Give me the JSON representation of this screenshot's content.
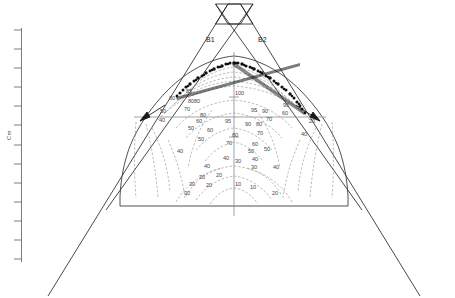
{
  "figure": {
    "kind": "radiotherapy-isodose-distribution",
    "axis": {
      "caption": "Cm",
      "orientation": "vertical",
      "tick_count": 13,
      "line_color": "#6e6f73"
    },
    "beams": [
      {
        "id": "B1",
        "label": "B1",
        "side": "left"
      },
      {
        "id": "B2",
        "label": "B2",
        "side": "right"
      }
    ],
    "colors": {
      "outline": "#1a1a1a",
      "isodose": "#8e8e92",
      "reference": "#8c8c90",
      "scatter": "#111111",
      "body": "#3c3c3e"
    },
    "isodose_levels": [
      100,
      95,
      90,
      85,
      80,
      70,
      60,
      50,
      40,
      30,
      20,
      10
    ],
    "isodose_labels": [
      {
        "text": "85",
        "x": 186,
        "y": 88
      },
      {
        "text": "80",
        "x": 169,
        "y": 95
      },
      {
        "text": "8080",
        "x": 188,
        "y": 98
      },
      {
        "text": "50",
        "x": 160,
        "y": 108
      },
      {
        "text": "70",
        "x": 184,
        "y": 106
      },
      {
        "text": "100",
        "x": 235,
        "y": 90
      },
      {
        "text": "95",
        "x": 283,
        "y": 102
      },
      {
        "text": "60",
        "x": 282,
        "y": 110
      },
      {
        "text": "80",
        "x": 200,
        "y": 112
      },
      {
        "text": "95",
        "x": 251,
        "y": 107
      },
      {
        "text": "90",
        "x": 262,
        "y": 108
      },
      {
        "text": "70",
        "x": 266,
        "y": 116
      },
      {
        "text": "40",
        "x": 159,
        "y": 117
      },
      {
        "text": "60",
        "x": 196,
        "y": 118
      },
      {
        "text": "95",
        "x": 225,
        "y": 118
      },
      {
        "text": "90",
        "x": 245,
        "y": 121
      },
      {
        "text": "80",
        "x": 256,
        "y": 121
      },
      {
        "text": "20",
        "x": 309,
        "y": 118
      },
      {
        "text": "50",
        "x": 188,
        "y": 125
      },
      {
        "text": "60",
        "x": 207,
        "y": 127
      },
      {
        "text": "80",
        "x": 232,
        "y": 132
      },
      {
        "text": "70",
        "x": 257,
        "y": 130
      },
      {
        "text": "40",
        "x": 301,
        "y": 131
      },
      {
        "text": "50",
        "x": 198,
        "y": 136
      },
      {
        "text": "70",
        "x": 226,
        "y": 140
      },
      {
        "text": "60",
        "x": 252,
        "y": 141
      },
      {
        "text": "40",
        "x": 177,
        "y": 148
      },
      {
        "text": "50",
        "x": 248,
        "y": 148
      },
      {
        "text": "50",
        "x": 264,
        "y": 146
      },
      {
        "text": "40",
        "x": 223,
        "y": 155
      },
      {
        "text": "30",
        "x": 235,
        "y": 158
      },
      {
        "text": "40",
        "x": 252,
        "y": 156
      },
      {
        "text": "40",
        "x": 204,
        "y": 163
      },
      {
        "text": "30",
        "x": 251,
        "y": 164
      },
      {
        "text": "40",
        "x": 273,
        "y": 164
      },
      {
        "text": "30",
        "x": 199,
        "y": 174
      },
      {
        "text": "20",
        "x": 216,
        "y": 172
      },
      {
        "text": "30",
        "x": 189,
        "y": 181
      },
      {
        "text": "20",
        "x": 206,
        "y": 182
      },
      {
        "text": "10",
        "x": 235,
        "y": 181
      },
      {
        "text": "10",
        "x": 250,
        "y": 184
      },
      {
        "text": "30",
        "x": 184,
        "y": 190
      },
      {
        "text": "20",
        "x": 272,
        "y": 190
      }
    ]
  }
}
